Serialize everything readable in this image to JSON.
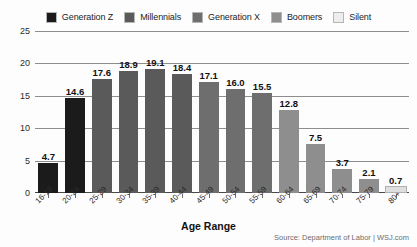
{
  "chart_data": {
    "type": "bar",
    "title": "",
    "xlabel": "Age Range",
    "ylabel": "",
    "ylim": [
      0,
      25
    ],
    "yticks": [
      0,
      5,
      10,
      15,
      20,
      25
    ],
    "grid": true,
    "legend_position": "top-center",
    "source": "Source: Department of Labor | WSJ.com",
    "categories": [
      "16-19",
      "20-24",
      "25-29",
      "30-34",
      "35-39",
      "40-44",
      "45-49",
      "50-54",
      "55-59",
      "60-64",
      "65-69",
      "70-74",
      "75-79",
      "80+"
    ],
    "values": [
      4.7,
      14.6,
      17.6,
      18.9,
      19.1,
      18.4,
      17.1,
      16.0,
      15.5,
      12.8,
      7.5,
      3.7,
      2.1,
      0.7
    ],
    "value_labels": [
      "4.7",
      "14.6",
      "17.6",
      "18.9",
      "19.1",
      "18.4",
      "17.1",
      "16.0",
      "15.5",
      "12.8",
      "7.5",
      "3.7",
      "2.1",
      "0.7"
    ],
    "bar_generation": [
      "Generation Z",
      "Generation Z",
      "Millennials",
      "Millennials",
      "Millennials",
      "Millennials",
      "Generation X",
      "Generation X",
      "Generation X",
      "Boomers",
      "Boomers",
      "Boomers",
      "Boomers",
      "Silent"
    ],
    "bar_colors": [
      "#1b1b1b",
      "#1b1b1b",
      "#5a5a5a",
      "#5a5a5a",
      "#5a5a5a",
      "#5a5a5a",
      "#6e6e6e",
      "#6e6e6e",
      "#6e6e6e",
      "#8e8e8e",
      "#8e8e8e",
      "#8e8e8e",
      "#8e8e8e",
      "#dedede"
    ],
    "legend": [
      {
        "label": "Generation Z",
        "color": "#1b1b1b"
      },
      {
        "label": "Millennials",
        "color": "#5a5a5a"
      },
      {
        "label": "Generation X",
        "color": "#6e6e6e"
      },
      {
        "label": "Boomers",
        "color": "#8e8e8e"
      },
      {
        "label": "Silent",
        "color": "#ededed"
      }
    ]
  }
}
